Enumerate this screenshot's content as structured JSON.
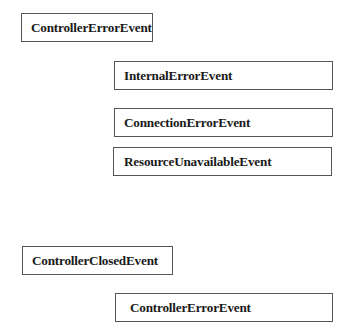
{
  "diagram": {
    "groups": [
      {
        "parent": {
          "label": "ControllerErrorEvent"
        },
        "children": [
          {
            "label": "InternalErrorEvent"
          },
          {
            "label": "ConnectionErrorEvent"
          },
          {
            "label": "ResourceUnavailableEvent"
          }
        ]
      },
      {
        "parent": {
          "label": "ControllerClosedEvent"
        },
        "children": [
          {
            "label": "ControllerErrorEvent"
          }
        ]
      }
    ]
  }
}
